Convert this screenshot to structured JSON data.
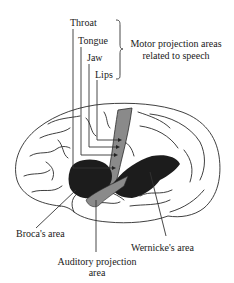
{
  "figure": {
    "type": "brain-lateral-view",
    "motor_labels": [
      "Throat",
      "Tongue",
      "Jaw",
      "Lips"
    ],
    "motor_group_label": [
      "Motor projection areas",
      "related to speech"
    ],
    "regions": {
      "broca": {
        "label": "Broca's area",
        "color": "#1c1c1c"
      },
      "wernicke": {
        "label": "Wernicke's area",
        "color": "#1c1c1c"
      },
      "motor_strip": {
        "color": "#8a8a8a"
      },
      "auditory": {
        "label": [
          "Auditory projection",
          "area"
        ],
        "color": "#8a8a8a"
      }
    }
  }
}
